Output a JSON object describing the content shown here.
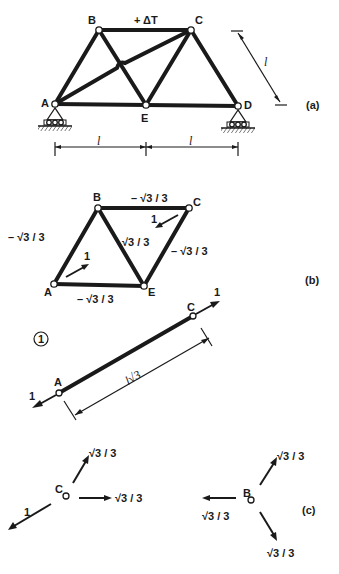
{
  "figure_a": {
    "label": "(a)",
    "nodes": {
      "A": "A",
      "B": "B",
      "C": "C",
      "D": "D",
      "E": "E"
    },
    "load_label": "+ ΔT",
    "dim_left": "l",
    "dim_right": "l",
    "dim_diag": "l"
  },
  "figure_b": {
    "label": "(b)",
    "nodes": {
      "A": "A",
      "B": "B",
      "C": "C",
      "E": "E"
    },
    "forces": {
      "BC": "– √3 / 3",
      "AB": "– √3 / 3",
      "BE": "√3 / 3",
      "CE": "– √3 / 3",
      "AE": "– √3 / 3"
    },
    "unit_load_A": "1",
    "unit_load_C": "1"
  },
  "figure_1": {
    "marker": "1",
    "nodes": {
      "A": "A",
      "C": "C"
    },
    "force_A": "1",
    "force_C": "1",
    "length_label": "l√3"
  },
  "figure_c": {
    "label": "(c)",
    "node_C": {
      "name": "C",
      "up_right": "√3 / 3",
      "right": "√3 / 3",
      "down_left": "1"
    },
    "node_B": {
      "name": "B",
      "up_right": "√3 / 3",
      "left": "√3 / 3",
      "down_right": "√3 / 3"
    }
  }
}
